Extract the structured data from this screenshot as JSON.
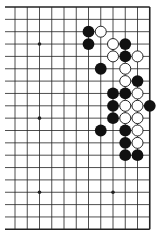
{
  "diagram": {
    "type": "go-board-fragment",
    "colors": {
      "background": "#ffffff",
      "line": "#222222",
      "black_stone": "#111111",
      "white_stone_fill": "#ffffff",
      "white_stone_stroke": "#111111"
    },
    "grid": {
      "columns_visible": 12,
      "rows_visible": 19,
      "origin_x": 15,
      "origin_y": 7,
      "spacing_x": 12.25,
      "spacing_y": 12.35,
      "left_edge_open": true,
      "top_edge": true,
      "right_edge": true,
      "bottom_edge": true
    },
    "hoshi": [
      {
        "col": 2,
        "row": 3
      },
      {
        "col": 2,
        "row": 9
      },
      {
        "col": 2,
        "row": 15
      },
      {
        "col": 8,
        "row": 15
      }
    ],
    "stones": {
      "black": [
        {
          "col": 6,
          "row": 2
        },
        {
          "col": 6,
          "row": 3
        },
        {
          "col": 9,
          "row": 3
        },
        {
          "col": 9,
          "row": 4
        },
        {
          "col": 7,
          "row": 5
        },
        {
          "col": 10,
          "row": 6
        },
        {
          "col": 8,
          "row": 7
        },
        {
          "col": 9,
          "row": 7
        },
        {
          "col": 8,
          "row": 8
        },
        {
          "col": 11,
          "row": 8
        },
        {
          "col": 8,
          "row": 9
        },
        {
          "col": 7,
          "row": 10
        },
        {
          "col": 9,
          "row": 10
        },
        {
          "col": 9,
          "row": 11
        },
        {
          "col": 9,
          "row": 12
        },
        {
          "col": 10,
          "row": 12
        }
      ],
      "white": [
        {
          "col": 7,
          "row": 2
        },
        {
          "col": 8,
          "row": 3
        },
        {
          "col": 8,
          "row": 4
        },
        {
          "col": 10,
          "row": 4
        },
        {
          "col": 9,
          "row": 5
        },
        {
          "col": 9,
          "row": 6
        },
        {
          "col": 10,
          "row": 7
        },
        {
          "col": 9,
          "row": 8
        },
        {
          "col": 10,
          "row": 8
        },
        {
          "col": 9,
          "row": 9
        },
        {
          "col": 10,
          "row": 9
        },
        {
          "col": 10,
          "row": 10
        },
        {
          "col": 10,
          "row": 11
        }
      ]
    }
  }
}
